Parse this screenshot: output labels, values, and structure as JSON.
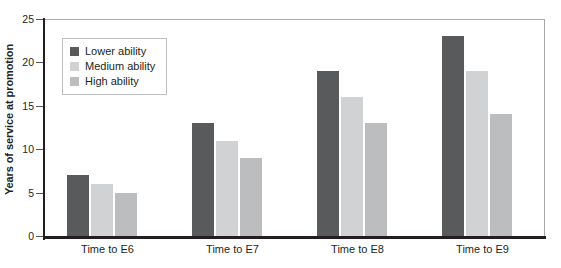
{
  "chart_data": {
    "type": "bar",
    "title": "",
    "subtitle": "",
    "xlabel": "",
    "ylabel": "Years of service at promotion",
    "categories": [
      "Time to E6",
      "Time to E7",
      "Time to E8",
      "Time to E9"
    ],
    "series": [
      {
        "name": "Lower ability",
        "color": "#595a5c",
        "values": [
          7,
          13,
          19,
          23
        ]
      },
      {
        "name": "Medium ability",
        "color": "#d0d2d3",
        "values": [
          6,
          11,
          16,
          19
        ]
      },
      {
        "name": "High ability",
        "color": "#bbbdbf",
        "values": [
          5,
          9,
          13,
          14
        ]
      }
    ],
    "ylim": [
      0,
      25
    ],
    "yticks": [
      0,
      5,
      10,
      15,
      20,
      25
    ],
    "ytick_labels": [
      "0",
      "5",
      "10",
      "15",
      "20",
      "25"
    ],
    "grid": false,
    "legend_position": "top-left",
    "legend_entries": [
      "Lower ability",
      "Medium ability",
      "High ability"
    ],
    "annotations": []
  },
  "colors": {
    "axis": "#231f20",
    "frame": "#a7a9ac",
    "text": "#231f20",
    "background": "#ffffff",
    "legend_border": "#bcbec0"
  }
}
